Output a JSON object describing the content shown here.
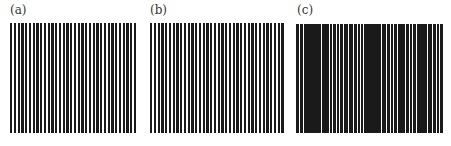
{
  "panels": [
    {
      "id": "a",
      "label": "(a)",
      "label_pos": {
        "x": 10,
        "y": 4
      },
      "grating": {
        "x": 10,
        "y": 23,
        "width": 127,
        "height": 110
      },
      "pattern": "regular",
      "bar_color": "#1a1a1a",
      "period": 3.75,
      "bar_width": 2.3,
      "bar_count": 34
    },
    {
      "id": "b",
      "label": "(b)",
      "label_pos": {
        "x": 150,
        "y": 4
      },
      "grating": {
        "x": 150,
        "y": 23,
        "width": 135,
        "height": 110
      },
      "pattern": "regular",
      "bar_color": "#1a1a1a",
      "period": 3.75,
      "bar_width": 2.4,
      "bar_count": 36
    },
    {
      "id": "c",
      "label": "(c)",
      "label_pos": {
        "x": 297,
        "y": 4
      },
      "grating": {
        "x": 296,
        "y": 24,
        "width": 147,
        "height": 109
      },
      "pattern": "irregular",
      "bar_color": "#1a1a1a",
      "bars": [
        [
          0,
          3.2
        ],
        [
          3.8,
          3.4
        ],
        [
          7.8,
          3.0
        ],
        [
          11.4,
          4.2
        ],
        [
          16.2,
          3.6
        ],
        [
          20.4,
          4.6
        ],
        [
          25.6,
          3.0
        ],
        [
          29.2,
          3.6
        ],
        [
          33.6,
          2.4
        ],
        [
          36.8,
          3.0
        ],
        [
          40.6,
          2.4
        ],
        [
          43.8,
          3.2
        ],
        [
          47.6,
          4.4
        ],
        [
          52.6,
          4.4
        ],
        [
          57.8,
          3.0
        ],
        [
          61.6,
          2.2
        ],
        [
          64.8,
          2.6
        ],
        [
          68.2,
          2.4
        ],
        [
          71.4,
          3.2
        ],
        [
          75.2,
          4.4
        ],
        [
          80.2,
          4.8
        ],
        [
          85.6,
          4.4
        ],
        [
          90.6,
          3.2
        ],
        [
          94.6,
          2.8
        ],
        [
          98.2,
          3.2
        ],
        [
          102.0,
          3.6
        ],
        [
          106.4,
          2.6
        ],
        [
          109.8,
          3.2
        ],
        [
          113.8,
          2.4
        ],
        [
          117.0,
          3.2
        ],
        [
          121.0,
          4.6
        ],
        [
          126.2,
          5.0
        ],
        [
          132.0,
          4.0
        ],
        [
          136.8,
          3.0
        ],
        [
          140.6,
          2.6
        ],
        [
          143.8,
          3.2
        ]
      ]
    }
  ]
}
